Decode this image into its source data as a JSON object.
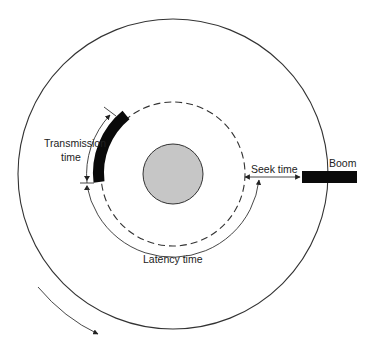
{
  "diagram": {
    "labels": {
      "transmission_line1": "Transmission",
      "transmission_line2": "time",
      "seek": "Seek time",
      "boom": "Boom",
      "latency": "Latency time"
    },
    "colors": {
      "line": "#333333",
      "hub_fill": "#c6c6c6",
      "record": "#0a0a0a",
      "background": "#ffffff"
    },
    "geometry": {
      "center": [
        173,
        174
      ],
      "outer_radius": 155,
      "track_radius": 72,
      "hub_radius": 30,
      "latency_arc_radius": 87
    }
  }
}
